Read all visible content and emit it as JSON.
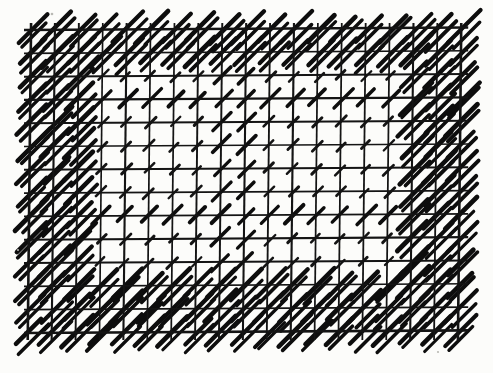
{
  "figure": {
    "title": "Hatched grid pattern",
    "medium": "scanned line drawing",
    "background_color": "#fcfcfa",
    "ink_color": "#141414",
    "canvas": {
      "width": 493,
      "height": 373
    }
  },
  "grid": {
    "origin_x": 31,
    "origin_y": 30,
    "spacing_x": 23.9,
    "spacing_y": 23.3,
    "columns": 19,
    "rows": 14,
    "line_width_major": 2.6,
    "line_width_minor": 1.9,
    "overhang": 7,
    "skew_degrees": -0.6,
    "right_edge": 465,
    "bottom_edge": 335
  },
  "hatch": {
    "angle_degrees": 45,
    "direction": "lower-left to upper-right",
    "short_length": 13,
    "short_width": 2.7,
    "long_length": 40,
    "long_width": 4.4,
    "medium_length": 24,
    "medium_width": 3.6
  },
  "density_bands": {
    "note": "Band membership is given in grid-cell index ranges (0-based from origin).",
    "top_rows": [
      0,
      1
    ],
    "bottom_rows": [
      11,
      12,
      13
    ],
    "left_columns": [
      0,
      1,
      2
    ],
    "right_columns": [
      16,
      17,
      18
    ],
    "center_columns": [
      8,
      9
    ],
    "center_rows": [
      3,
      8
    ],
    "dense_label": "bold long diagonals",
    "sparse_label": "short tick diagonals"
  },
  "specks": [
    {
      "x": 52,
      "y": 14,
      "r": 1.3
    },
    {
      "x": 438,
      "y": 352,
      "r": 1.1
    },
    {
      "x": 18,
      "y": 250,
      "r": 1.0
    }
  ]
}
